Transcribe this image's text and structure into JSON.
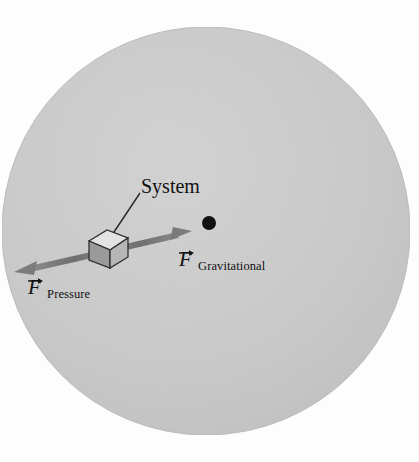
{
  "figure": {
    "title_fragment": "",
    "background_color": "#fdfdfd"
  },
  "earth": {
    "name": "earth-disk",
    "fill_color": "#c9c9c9",
    "edge_color": "#bdbdbd",
    "center": {
      "x": 206,
      "y": 231
    },
    "radius": 204
  },
  "center_point": {
    "name": "earth-center-dot",
    "color": "#111111",
    "x": 209,
    "y": 223,
    "radius": 7
  },
  "system_block": {
    "label": "System",
    "top_face_color": "#e0e0e0",
    "left_face_color": "#999999",
    "right_face_color": "#b5b5b5",
    "edge_color": "#333333"
  },
  "forces": [
    {
      "name": "gravitational",
      "symbol": "F",
      "subscript": "Gravitational",
      "direction": "up-right toward center of Earth",
      "color": "#7b7b7b"
    },
    {
      "name": "pressure",
      "symbol": "F",
      "subscript": "Pressure",
      "direction": "down-left away from center of Earth",
      "color": "#7b7b7b"
    }
  ]
}
